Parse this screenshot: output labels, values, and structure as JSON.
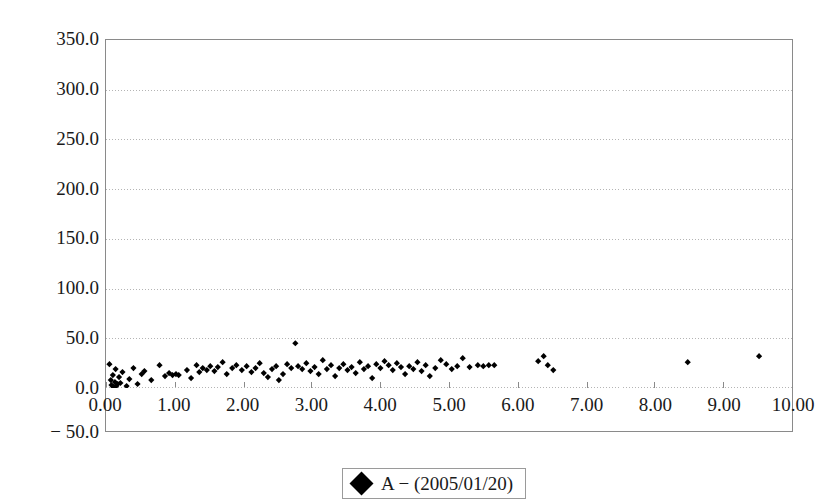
{
  "chart_data": {
    "type": "scatter",
    "title": "",
    "xlabel": "",
    "ylabel": "",
    "xlim": [
      0.0,
      10.0
    ],
    "ylim": [
      -50.0,
      350.0
    ],
    "y_axis_display_min": 0.0,
    "grid": true,
    "grid_style": "dotted horizontal gridlines",
    "legend_position": "bottom-center",
    "x_ticks": [
      "0.00",
      "1.00",
      "2.00",
      "3.00",
      "4.00",
      "5.00",
      "6.00",
      "7.00",
      "8.00",
      "9.00",
      "10.00"
    ],
    "x_tick_values": [
      0,
      1,
      2,
      3,
      4,
      5,
      6,
      7,
      8,
      9,
      10
    ],
    "y_ticks": [
      "350.0",
      "300.0",
      "250.0",
      "200.0",
      "150.0",
      "100.0",
      "50.0",
      "0.0",
      "-50.0"
    ],
    "y_tick_values": [
      350,
      300,
      250,
      200,
      150,
      100,
      50,
      0,
      -50
    ],
    "y_tick_minus_prefix": "−",
    "marker_color": "#000000",
    "marker_shape": "diamond",
    "axis_color": "#8a8a8a",
    "grid_color": "#b4b4b4",
    "series": [
      {
        "name": "A − (2005/01/20)",
        "points": [
          [
            0.05,
            24
          ],
          [
            0.07,
            8
          ],
          [
            0.08,
            3
          ],
          [
            0.1,
            13
          ],
          [
            0.11,
            1
          ],
          [
            0.13,
            6
          ],
          [
            0.14,
            19
          ],
          [
            0.15,
            2
          ],
          [
            0.17,
            4
          ],
          [
            0.19,
            11
          ],
          [
            0.21,
            5
          ],
          [
            0.24,
            16
          ],
          [
            0.3,
            2
          ],
          [
            0.34,
            9
          ],
          [
            0.4,
            20
          ],
          [
            0.46,
            4
          ],
          [
            0.52,
            14
          ],
          [
            0.56,
            17
          ],
          [
            0.6,
            -5
          ],
          [
            0.66,
            8
          ],
          [
            0.78,
            23
          ],
          [
            0.86,
            12
          ],
          [
            0.92,
            15
          ],
          [
            0.97,
            13
          ],
          [
            1.02,
            14
          ],
          [
            1.06,
            13
          ],
          [
            1.18,
            18
          ],
          [
            1.24,
            10
          ],
          [
            1.32,
            23
          ],
          [
            1.36,
            16
          ],
          [
            1.41,
            20
          ],
          [
            1.47,
            18
          ],
          [
            1.52,
            22
          ],
          [
            1.58,
            17
          ],
          [
            1.63,
            21
          ],
          [
            1.7,
            26
          ],
          [
            1.76,
            14
          ],
          [
            1.84,
            20
          ],
          [
            1.9,
            23
          ],
          [
            1.98,
            18
          ],
          [
            2.05,
            22
          ],
          [
            2.12,
            16
          ],
          [
            2.18,
            20
          ],
          [
            2.24,
            25
          ],
          [
            2.3,
            15
          ],
          [
            2.36,
            11
          ],
          [
            2.42,
            19
          ],
          [
            2.48,
            22
          ],
          [
            2.52,
            8
          ],
          [
            2.58,
            14
          ],
          [
            2.64,
            24
          ],
          [
            2.7,
            20
          ],
          [
            2.76,
            45
          ],
          [
            2.8,
            22
          ],
          [
            2.86,
            19
          ],
          [
            2.92,
            25
          ],
          [
            2.98,
            17
          ],
          [
            3.04,
            21
          ],
          [
            3.1,
            14
          ],
          [
            3.16,
            28
          ],
          [
            3.22,
            19
          ],
          [
            3.28,
            23
          ],
          [
            3.34,
            12
          ],
          [
            3.4,
            20
          ],
          [
            3.46,
            24
          ],
          [
            3.52,
            18
          ],
          [
            3.58,
            21
          ],
          [
            3.64,
            15
          ],
          [
            3.7,
            26
          ],
          [
            3.76,
            19
          ],
          [
            3.82,
            22
          ],
          [
            3.88,
            10
          ],
          [
            3.94,
            24
          ],
          [
            4.0,
            20
          ],
          [
            4.06,
            27
          ],
          [
            4.12,
            23
          ],
          [
            4.18,
            18
          ],
          [
            4.24,
            25
          ],
          [
            4.3,
            21
          ],
          [
            4.36,
            14
          ],
          [
            4.42,
            22
          ],
          [
            4.48,
            19
          ],
          [
            4.54,
            26
          ],
          [
            4.6,
            17
          ],
          [
            4.66,
            23
          ],
          [
            4.72,
            12
          ],
          [
            4.8,
            20
          ],
          [
            4.88,
            28
          ],
          [
            4.96,
            24
          ],
          [
            5.04,
            19
          ],
          [
            5.12,
            22
          ],
          [
            5.2,
            30
          ],
          [
            5.3,
            21
          ],
          [
            5.42,
            23
          ],
          [
            5.5,
            22
          ],
          [
            5.58,
            23
          ],
          [
            5.66,
            23
          ],
          [
            6.3,
            27
          ],
          [
            6.38,
            32
          ],
          [
            6.44,
            23
          ],
          [
            6.52,
            18
          ],
          [
            8.48,
            26
          ],
          [
            9.52,
            32
          ]
        ]
      }
    ]
  },
  "legend": {
    "entries": [
      {
        "label": "A − (2005/01/20)",
        "marker": "diamond-marker",
        "color": "#000000"
      }
    ]
  }
}
